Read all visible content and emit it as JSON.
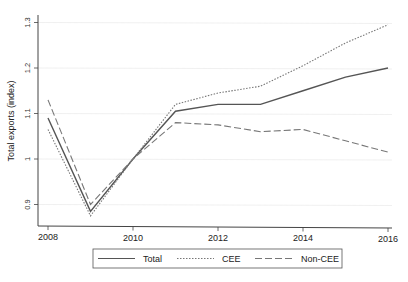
{
  "chart_data": {
    "type": "line",
    "title": "",
    "xlabel": "",
    "ylabel": "Total exports (index)",
    "x": [
      2008,
      2009,
      2010,
      2011,
      2012,
      2013,
      2014,
      2015,
      2016
    ],
    "x_ticks": [
      "2008",
      "2010",
      "2012",
      "2014",
      "2016"
    ],
    "y_ticks": [
      "0.9",
      "1",
      "1.1",
      "1.2",
      "1.3"
    ],
    "xlim": [
      2008,
      2016
    ],
    "ylim": [
      0.85,
      1.32
    ],
    "grid": true,
    "legend_position": "bottom",
    "series": [
      {
        "name": "Total",
        "style": "solid",
        "color": "#555555",
        "values": [
          1.09,
          0.885,
          1.0,
          1.105,
          1.12,
          1.12,
          1.15,
          1.18,
          1.2
        ]
      },
      {
        "name": "CEE",
        "style": "dotted",
        "color": "#777777",
        "values": [
          1.065,
          0.875,
          1.0,
          1.12,
          1.145,
          1.16,
          1.205,
          1.255,
          1.295
        ]
      },
      {
        "name": "Non-CEE",
        "style": "dashed",
        "color": "#777777",
        "values": [
          1.13,
          0.9,
          1.0,
          1.08,
          1.075,
          1.06,
          1.065,
          1.04,
          1.015
        ]
      }
    ]
  },
  "legend": {
    "items": [
      "Total",
      "CEE",
      "Non-CEE"
    ]
  }
}
